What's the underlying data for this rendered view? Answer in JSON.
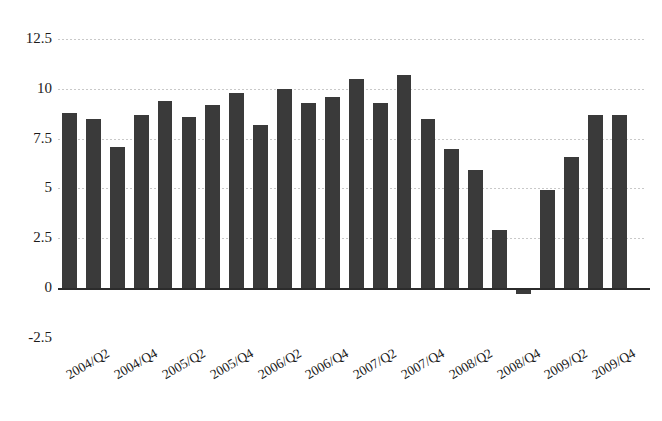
{
  "chart_data": {
    "type": "bar",
    "title": "",
    "subtitle": "",
    "xlabel": "",
    "ylabel": "",
    "ylim": [
      -2.5,
      12.5
    ],
    "ytick_labels": [
      "12.5",
      "10",
      "7.5",
      "5",
      "2.5",
      "0",
      "-2.5"
    ],
    "ytick_values": [
      12.5,
      10,
      7.5,
      5,
      2.5,
      0,
      -2.5
    ],
    "grid": true,
    "legend": "none",
    "bar_color": "#3a3a3a",
    "grid_color": "#c9c9c9",
    "axis_color": "#2b2b2b",
    "categories": [
      "2004/Q1",
      "2004/Q2",
      "2004/Q3",
      "2004/Q4",
      "2005/Q1",
      "2005/Q2",
      "2005/Q3",
      "2005/Q4",
      "2006/Q1",
      "2006/Q2",
      "2006/Q3",
      "2006/Q4",
      "2007/Q1",
      "2007/Q2",
      "2007/Q3",
      "2007/Q4",
      "2008/Q1",
      "2008/Q2",
      "2008/Q3",
      "2008/Q4",
      "2009/Q1",
      "2009/Q2",
      "2009/Q3",
      "2009/Q4"
    ],
    "values": [
      8.8,
      8.5,
      7.1,
      8.7,
      9.4,
      8.6,
      9.2,
      9.8,
      8.2,
      10.0,
      9.3,
      9.6,
      10.5,
      9.3,
      10.7,
      8.5,
      7.0,
      5.9,
      2.9,
      -0.2,
      4.9,
      6.6,
      8.7,
      8.7
    ],
    "visible_tick_labels": [
      "2004/Q2",
      "2004/Q4",
      "2005/Q2",
      "2005/Q4",
      "2006/Q2",
      "2006/Q4",
      "2007/Q2",
      "2007/Q4",
      "2008/Q2",
      "2008/Q4",
      "2009/Q2",
      "2009/Q4"
    ],
    "tick_label_rotation_deg": -30
  }
}
